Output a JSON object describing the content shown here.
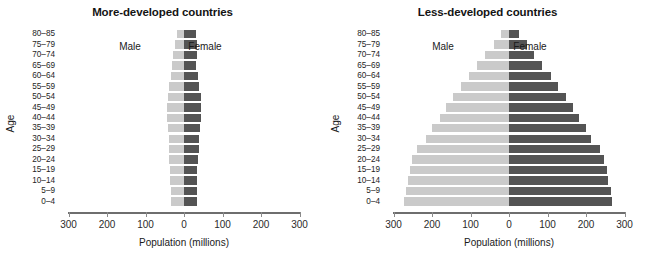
{
  "figure": {
    "xaxis_title": "Population (millions)",
    "yaxis_title": "Age",
    "male_label": "Male",
    "female_label": "Female",
    "tick_labels": [
      "300",
      "200",
      "100",
      "0",
      "100",
      "200",
      "300"
    ],
    "age_groups": [
      "80–85",
      "75–79",
      "70–74",
      "65–69",
      "60–64",
      "55–59",
      "50–54",
      "45–49",
      "40–44",
      "35–39",
      "30–34",
      "25–29",
      "20–24",
      "15–19",
      "10–14",
      "5–9",
      "0–4"
    ],
    "colors": {
      "male": "#cacaca",
      "female": "#545454",
      "axis": "#6e6e6e",
      "text": "#1a1a1a"
    }
  },
  "chart_data": [
    {
      "type": "bar",
      "title": "More-developed countries",
      "subtype": "population-pyramid",
      "xlabel": "Population (millions)",
      "ylabel": "Age",
      "xlim": [
        -300,
        300
      ],
      "xticks": [
        -300,
        -200,
        -100,
        0,
        100,
        200,
        300
      ],
      "xticklabels": [
        "300",
        "200",
        "100",
        "0",
        "100",
        "200",
        "300"
      ],
      "grid": false,
      "legend": [
        "Male",
        "Female"
      ],
      "legend_position": "inside-top",
      "categories": [
        "80–85",
        "75–79",
        "70–74",
        "65–69",
        "60–64",
        "55–59",
        "50–54",
        "45–49",
        "40–44",
        "35–39",
        "30–34",
        "25–29",
        "20–24",
        "15–19",
        "10–14",
        "5–9",
        "0–4"
      ],
      "series": [
        {
          "name": "Male",
          "side": "left",
          "values": [
            18,
            24,
            28,
            30,
            34,
            38,
            42,
            44,
            44,
            42,
            40,
            38,
            38,
            36,
            36,
            34,
            34
          ]
        },
        {
          "name": "Female",
          "side": "right",
          "values": [
            30,
            34,
            34,
            32,
            36,
            40,
            43,
            44,
            44,
            42,
            40,
            38,
            37,
            34,
            34,
            33,
            33
          ]
        }
      ]
    },
    {
      "type": "bar",
      "title": "Less-developed countries",
      "subtype": "population-pyramid",
      "xlabel": "Population (millions)",
      "ylabel": "Age",
      "xlim": [
        -300,
        300
      ],
      "xticks": [
        -300,
        -200,
        -100,
        0,
        100,
        200,
        300
      ],
      "xticklabels": [
        "300",
        "200",
        "100",
        "0",
        "100",
        "200",
        "300"
      ],
      "grid": false,
      "legend": [
        "Male",
        "Female"
      ],
      "legend_position": "inside-top",
      "categories": [
        "80–85",
        "75–79",
        "70–74",
        "65–69",
        "60–64",
        "55–59",
        "50–54",
        "45–49",
        "40–44",
        "35–39",
        "30–34",
        "25–29",
        "20–24",
        "15–19",
        "10–14",
        "5–9",
        "0–4"
      ],
      "series": [
        {
          "name": "Male",
          "side": "left",
          "values": [
            20,
            40,
            62,
            82,
            104,
            124,
            146,
            164,
            180,
            200,
            215,
            238,
            252,
            258,
            262,
            268,
            272
          ]
        },
        {
          "name": "Female",
          "side": "right",
          "values": [
            26,
            46,
            66,
            86,
            108,
            128,
            148,
            166,
            182,
            200,
            214,
            236,
            248,
            254,
            258,
            264,
            268
          ]
        }
      ]
    }
  ]
}
